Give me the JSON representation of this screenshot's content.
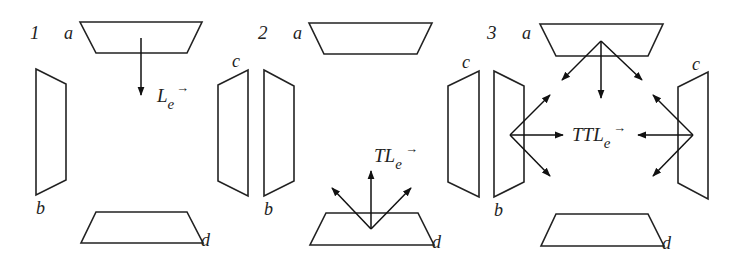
{
  "diagram": {
    "stroke_color": "#222222",
    "background": "#ffffff",
    "panels": [
      {
        "number": "1",
        "surface_labels": {
          "a": "a",
          "b": "b",
          "c": "c",
          "d": "d"
        },
        "operator": {
          "prefix": "",
          "symbol": "L",
          "subscript": "e",
          "vector": "→"
        },
        "arrows_from": "a",
        "arrow_directions": [
          "down"
        ]
      },
      {
        "number": "2",
        "surface_labels": {
          "a": "a",
          "b": "b",
          "c": "c",
          "d": "d"
        },
        "operator": {
          "prefix": "T",
          "symbol": "L",
          "subscript": "e",
          "vector": "→"
        },
        "arrows_from": "d",
        "arrow_directions": [
          "up-left",
          "up",
          "up-right"
        ]
      },
      {
        "number": "3",
        "surface_labels": {
          "a": "a",
          "b": "b",
          "c": "c",
          "d": "d"
        },
        "operator": {
          "prefix": "TT",
          "symbol": "L",
          "subscript": "e",
          "vector": "→"
        },
        "arrows_from": [
          "a",
          "b",
          "c"
        ],
        "arrow_directions": [
          "down-left",
          "down",
          "down-right",
          "up-right",
          "right",
          "down-right",
          "up-left",
          "left",
          "down-left"
        ]
      }
    ]
  }
}
